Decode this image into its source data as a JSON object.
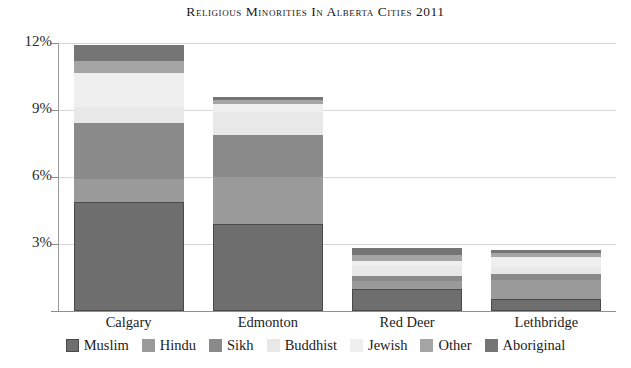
{
  "chart_data": {
    "type": "bar",
    "subtype": "stacked-bar",
    "title": "Religious Minorities in Alberta Cities 2011",
    "xlabel": "",
    "ylabel": "",
    "ylim": [
      0,
      12
    ],
    "ytick_values": [
      3,
      6,
      9,
      12
    ],
    "ytick_labels": [
      "3%",
      "6%",
      "9%",
      "12%"
    ],
    "grid": true,
    "legend_position": "bottom",
    "units": "percent",
    "categories": [
      "Calgary",
      "Edmonton",
      "Red Deer",
      "Lethbridge"
    ],
    "series": [
      {
        "name": "Muslim",
        "color": "#6e6e6e",
        "values": [
          4.9,
          3.9,
          1.0,
          0.55
        ]
      },
      {
        "name": "Hindu",
        "color": "#9a9a9a",
        "values": [
          1.0,
          2.1,
          0.35,
          0.85
        ]
      },
      {
        "name": "Sikh",
        "color": "#8a8a8a",
        "values": [
          2.5,
          1.9,
          0.2,
          0.25
        ]
      },
      {
        "name": "Buddhist",
        "color": "#e8e8e8",
        "values": [
          0.75,
          1.0,
          0.45,
          0.3
        ]
      },
      {
        "name": "Jewish",
        "color": "#efefef",
        "values": [
          1.5,
          0.35,
          0.25,
          0.45
        ]
      },
      {
        "name": "Other",
        "color": "#a5a5a5",
        "values": [
          0.55,
          0.2,
          0.25,
          0.2
        ]
      },
      {
        "name": "Aboriginal",
        "color": "#757575",
        "values": [
          0.7,
          0.15,
          0.3,
          0.15
        ]
      }
    ],
    "totals": [
      11.9,
      9.65,
      2.8,
      2.75
    ]
  },
  "legend": {
    "items": [
      {
        "label": "Muslim"
      },
      {
        "label": "Hindu"
      },
      {
        "label": "Sikh"
      },
      {
        "label": "Buddhist"
      },
      {
        "label": "Jewish"
      },
      {
        "label": "Other"
      },
      {
        "label": "Aboriginal"
      }
    ]
  }
}
